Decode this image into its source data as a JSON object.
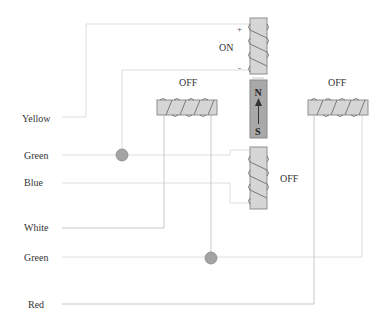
{
  "diagram": {
    "title": "",
    "wire_labels": {
      "yellow": "Yellow",
      "green_1": "Green",
      "blue": "Blue",
      "white": "White",
      "green_2": "Green",
      "red": "Red"
    },
    "coils": {
      "top_vertical": {
        "state": "ON",
        "plus": "+",
        "minus": "-"
      },
      "left_horizontal": {
        "state": "OFF"
      },
      "right_horizontal": {
        "state": "OFF"
      },
      "bottom_vertical": {
        "state": "OFF"
      }
    },
    "magnet": {
      "north": "N",
      "south": "S"
    },
    "colors": {
      "coil_fill": "#d6d6d6",
      "magnet_fill": "#a9a9a9",
      "node_fill": "#a3a3a3",
      "wire": "#c8c8c8",
      "text": "#333333"
    }
  }
}
